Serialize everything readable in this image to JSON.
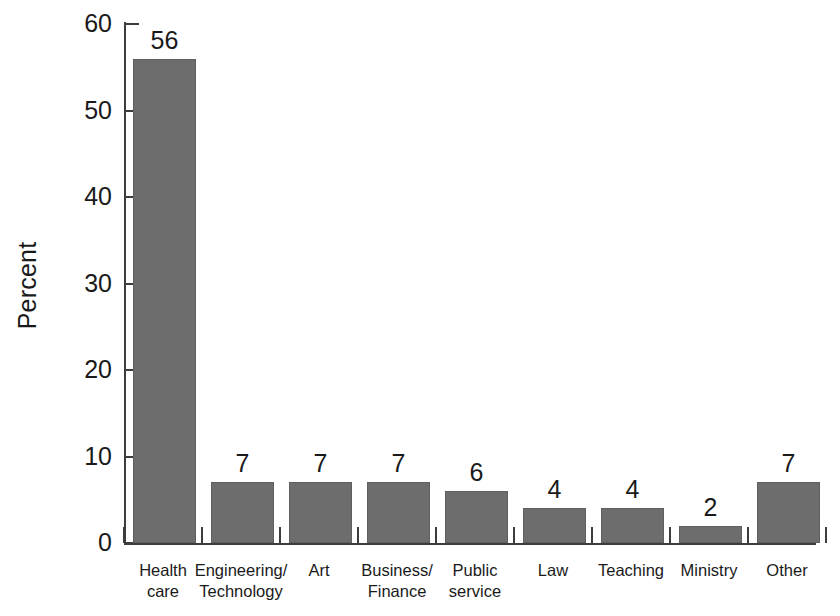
{
  "chart_data": {
    "type": "bar",
    "title": "",
    "xlabel": "",
    "ylabel": "Percent",
    "ylim": [
      0,
      60
    ],
    "yticks": [
      0,
      10,
      20,
      30,
      40,
      50,
      60
    ],
    "grid": false,
    "legend": null,
    "bar_color": "#6d6d6d",
    "axis_color": "#3d3d3d",
    "background": "#ffffff",
    "categories": [
      "Health care",
      "Engineering/ Technology",
      "Art",
      "Business/ Finance",
      "Public service",
      "Law",
      "Teaching",
      "Ministry",
      "Other"
    ],
    "values": [
      56,
      7,
      7,
      7,
      6,
      4,
      4,
      2,
      7
    ],
    "bars": [
      {
        "label_line1": "Health",
        "label_line2": "care",
        "value": 56,
        "value_label": "56"
      },
      {
        "label_line1": "Engineering/",
        "label_line2": "Technology",
        "value": 7,
        "value_label": "7"
      },
      {
        "label_line1": "Art",
        "label_line2": "",
        "value": 7,
        "value_label": "7"
      },
      {
        "label_line1": "Business/",
        "label_line2": "Finance",
        "value": 7,
        "value_label": "7"
      },
      {
        "label_line1": "Public",
        "label_line2": "service",
        "value": 6,
        "value_label": "6"
      },
      {
        "label_line1": "Law",
        "label_line2": "",
        "value": 4,
        "value_label": "4"
      },
      {
        "label_line1": "Teaching",
        "label_line2": "",
        "value": 4,
        "value_label": "4"
      },
      {
        "label_line1": "Ministry",
        "label_line2": "",
        "value": 2,
        "value_label": "2"
      },
      {
        "label_line1": "Other",
        "label_line2": "",
        "value": 7,
        "value_label": "7"
      }
    ]
  },
  "axis": {
    "y_title": "Percent",
    "y_tick_labels": [
      "60",
      "50",
      "40",
      "30",
      "20",
      "10",
      "0"
    ]
  }
}
